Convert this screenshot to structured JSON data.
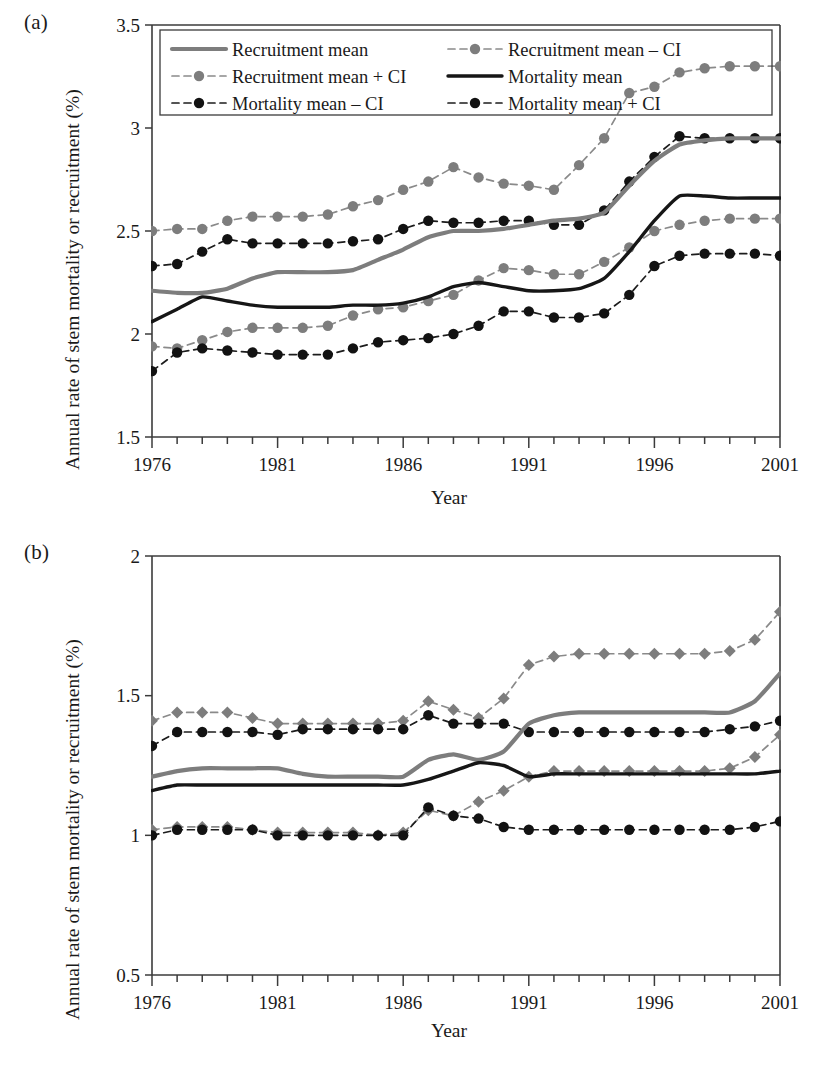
{
  "figure": {
    "axis_label_y": "Annual rate of stem mortality or recruitment (%)",
    "axis_label_x": "Year",
    "panel_a_letter": "(a)",
    "panel_b_letter": "(b)"
  },
  "legend": {
    "items": [
      {
        "label": "Recruitment mean",
        "style": "solid-gray",
        "marker": "none"
      },
      {
        "label": "Recruitment mean – CI",
        "style": "dash-gray",
        "marker": "circle"
      },
      {
        "label": "Recruitment mean + CI",
        "style": "dash-gray",
        "marker": "circle"
      },
      {
        "label": "Mortality mean",
        "style": "solid-black",
        "marker": "none"
      },
      {
        "label": "Mortality mean – CI",
        "style": "dash-black",
        "marker": "circle"
      },
      {
        "label": "Mortality mean + CI",
        "style": "dash-black",
        "marker": "circle"
      }
    ]
  },
  "colors": {
    "gray_series": "#7d7d7d",
    "black_series": "#161616",
    "axis": "#3b3b3b",
    "background": "#ffffff"
  },
  "chart_data": [
    {
      "panel": "(a)",
      "type": "line",
      "title": "",
      "xlabel": "Year",
      "ylabel": "Annual rate of stem mortality or recruitment (%)",
      "xlim": [
        1976,
        2001
      ],
      "ylim": [
        1.5,
        3.5
      ],
      "yticks": [
        1.5,
        2,
        2.5,
        3,
        3.5
      ],
      "ytick_labels": [
        "1.5",
        "2",
        "2.5",
        "3",
        "3.5"
      ],
      "xticks": [
        1976,
        1981,
        1986,
        1991,
        1996,
        2001
      ],
      "xtick_labels": [
        "1976",
        "1981",
        "1986",
        "1991",
        "1996",
        "2001"
      ],
      "minor_xticks_every": 1,
      "grid": false,
      "legend_position": "top-inside",
      "x": [
        1976,
        1977,
        1978,
        1979,
        1980,
        1981,
        1982,
        1983,
        1984,
        1985,
        1986,
        1987,
        1988,
        1989,
        1990,
        1991,
        1992,
        1993,
        1994,
        1995,
        1996,
        1997,
        1998,
        1999,
        2000,
        2001
      ],
      "series": [
        {
          "name": "Recruitment mean",
          "style": "solid-gray",
          "marker": "none",
          "values": [
            2.21,
            2.2,
            2.2,
            2.22,
            2.27,
            2.3,
            2.3,
            2.3,
            2.31,
            2.36,
            2.41,
            2.47,
            2.5,
            2.5,
            2.51,
            2.53,
            2.55,
            2.56,
            2.59,
            2.72,
            2.84,
            2.92,
            2.94,
            2.95,
            2.95,
            2.95
          ]
        },
        {
          "name": "Recruitment mean + CI",
          "style": "dash-gray",
          "marker": "circle",
          "values": [
            2.5,
            2.51,
            2.51,
            2.55,
            2.57,
            2.57,
            2.57,
            2.58,
            2.62,
            2.65,
            2.7,
            2.74,
            2.81,
            2.76,
            2.73,
            2.72,
            2.7,
            2.82,
            2.95,
            3.17,
            3.2,
            3.27,
            3.29,
            3.3,
            3.3,
            3.3
          ]
        },
        {
          "name": "Recruitment mean – CI",
          "style": "dash-gray",
          "marker": "circle",
          "values": [
            1.94,
            1.93,
            1.97,
            2.01,
            2.03,
            2.03,
            2.03,
            2.04,
            2.09,
            2.12,
            2.13,
            2.16,
            2.19,
            2.26,
            2.32,
            2.31,
            2.29,
            2.29,
            2.35,
            2.42,
            2.5,
            2.53,
            2.55,
            2.56,
            2.56,
            2.56
          ]
        },
        {
          "name": "Mortality mean",
          "style": "solid-black",
          "marker": "none",
          "values": [
            2.06,
            2.12,
            2.18,
            2.16,
            2.14,
            2.13,
            2.13,
            2.13,
            2.14,
            2.14,
            2.15,
            2.18,
            2.23,
            2.25,
            2.23,
            2.21,
            2.21,
            2.22,
            2.27,
            2.4,
            2.55,
            2.67,
            2.67,
            2.66,
            2.66,
            2.66
          ]
        },
        {
          "name": "Mortality mean + CI",
          "style": "dash-black",
          "marker": "circle",
          "values": [
            2.33,
            2.34,
            2.4,
            2.46,
            2.44,
            2.44,
            2.44,
            2.44,
            2.45,
            2.46,
            2.51,
            2.55,
            2.54,
            2.54,
            2.55,
            2.55,
            2.53,
            2.53,
            2.6,
            2.74,
            2.86,
            2.96,
            2.95,
            2.95,
            2.95,
            2.95
          ]
        },
        {
          "name": "Mortality mean – CI",
          "style": "dash-black",
          "marker": "circle",
          "values": [
            1.82,
            1.91,
            1.93,
            1.92,
            1.91,
            1.9,
            1.9,
            1.9,
            1.93,
            1.96,
            1.97,
            1.98,
            2.0,
            2.04,
            2.11,
            2.11,
            2.08,
            2.08,
            2.1,
            2.19,
            2.33,
            2.38,
            2.39,
            2.39,
            2.39,
            2.38
          ]
        }
      ]
    },
    {
      "panel": "(b)",
      "type": "line",
      "title": "",
      "xlabel": "Year",
      "ylabel": "Annual rate of stem mortality or recruitment (%)",
      "xlim": [
        1976,
        2001
      ],
      "ylim": [
        0.5,
        2.0
      ],
      "yticks": [
        0.5,
        1,
        1.5,
        2
      ],
      "ytick_labels": [
        "0.5",
        "1",
        "1.5",
        "2"
      ],
      "xticks": [
        1976,
        1981,
        1986,
        1991,
        1996,
        2001
      ],
      "xtick_labels": [
        "1976",
        "1981",
        "1986",
        "1991",
        "1996",
        "2001"
      ],
      "minor_xticks_every": 1,
      "grid": false,
      "legend_position": "none",
      "x": [
        1976,
        1977,
        1978,
        1979,
        1980,
        1981,
        1982,
        1983,
        1984,
        1985,
        1986,
        1987,
        1988,
        1989,
        1990,
        1991,
        1992,
        1993,
        1994,
        1995,
        1996,
        1997,
        1998,
        1999,
        2000,
        2001
      ],
      "series": [
        {
          "name": "Recruitment mean",
          "style": "solid-gray",
          "marker": "none",
          "values": [
            1.21,
            1.23,
            1.24,
            1.24,
            1.24,
            1.24,
            1.22,
            1.21,
            1.21,
            1.21,
            1.21,
            1.27,
            1.29,
            1.27,
            1.3,
            1.4,
            1.43,
            1.44,
            1.44,
            1.44,
            1.44,
            1.44,
            1.44,
            1.44,
            1.48,
            1.58
          ]
        },
        {
          "name": "Recruitment mean + CI",
          "style": "dash-gray",
          "marker": "diamond",
          "values": [
            1.41,
            1.44,
            1.44,
            1.44,
            1.42,
            1.4,
            1.4,
            1.4,
            1.4,
            1.4,
            1.41,
            1.48,
            1.45,
            1.42,
            1.49,
            1.61,
            1.64,
            1.65,
            1.65,
            1.65,
            1.65,
            1.65,
            1.65,
            1.66,
            1.7,
            1.8
          ]
        },
        {
          "name": "Recruitment mean – CI",
          "style": "dash-gray",
          "marker": "diamond",
          "values": [
            1.02,
            1.03,
            1.03,
            1.03,
            1.02,
            1.01,
            1.01,
            1.01,
            1.01,
            1.0,
            1.01,
            1.09,
            1.07,
            1.12,
            1.16,
            1.21,
            1.23,
            1.23,
            1.23,
            1.23,
            1.23,
            1.23,
            1.23,
            1.24,
            1.28,
            1.36
          ]
        },
        {
          "name": "Mortality mean",
          "style": "solid-black",
          "marker": "none",
          "values": [
            1.16,
            1.18,
            1.18,
            1.18,
            1.18,
            1.18,
            1.18,
            1.18,
            1.18,
            1.18,
            1.18,
            1.2,
            1.23,
            1.26,
            1.25,
            1.21,
            1.22,
            1.22,
            1.22,
            1.22,
            1.22,
            1.22,
            1.22,
            1.22,
            1.22,
            1.23
          ]
        },
        {
          "name": "Mortality mean + CI",
          "style": "dash-black",
          "marker": "circle",
          "values": [
            1.32,
            1.37,
            1.37,
            1.37,
            1.37,
            1.36,
            1.38,
            1.38,
            1.38,
            1.38,
            1.38,
            1.43,
            1.4,
            1.4,
            1.4,
            1.37,
            1.37,
            1.37,
            1.37,
            1.37,
            1.37,
            1.37,
            1.37,
            1.38,
            1.39,
            1.41
          ]
        },
        {
          "name": "Mortality mean – CI",
          "style": "dash-black",
          "marker": "circle",
          "values": [
            1.0,
            1.02,
            1.02,
            1.02,
            1.02,
            1.0,
            1.0,
            1.0,
            1.0,
            1.0,
            1.0,
            1.1,
            1.07,
            1.06,
            1.03,
            1.02,
            1.02,
            1.02,
            1.02,
            1.02,
            1.02,
            1.02,
            1.02,
            1.02,
            1.03,
            1.05
          ]
        }
      ]
    }
  ]
}
